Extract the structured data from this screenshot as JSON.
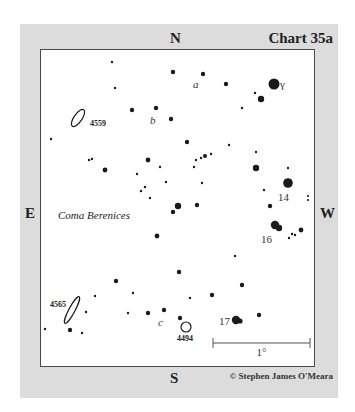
{
  "chart": {
    "title": "Chart 35a",
    "copyright": "© Stephen James O'Meara",
    "constellation": "Coma Berenices",
    "compass": {
      "north": "N",
      "south": "S",
      "east": "E",
      "west": "W"
    },
    "scale_bar": {
      "label": "1°",
      "x1": 213,
      "x2": 310,
      "y": 343
    }
  },
  "colors": {
    "frame": "#dcdcdc",
    "field": "#ffffff",
    "border": "#4a4a4a",
    "star": "#1a1a1a",
    "text": "#222222"
  },
  "labels": {
    "gamma": "γ",
    "star_14": "14",
    "star_16": "16",
    "star_17": "17",
    "a": "a",
    "b": "b",
    "c": "c"
  },
  "deep_sky_objects": [
    {
      "id": "4559",
      "label": "4559",
      "type": "galaxy",
      "cx": 78,
      "cy": 118,
      "rx": 4,
      "ry": 10,
      "rotate": 35,
      "label_x": 90,
      "label_y": 126
    },
    {
      "id": "4565",
      "label": "4565",
      "type": "galaxy",
      "cx": 72,
      "cy": 310,
      "rx": 3,
      "ry": 15,
      "rotate": 28,
      "label_x": 50,
      "label_y": 307
    },
    {
      "id": "4494",
      "label": "4494",
      "type": "galaxy",
      "cx": 186,
      "cy": 327,
      "rx": 5,
      "ry": 5,
      "rotate": 0,
      "label_x": 177,
      "label_y": 341
    }
  ],
  "stars": [
    {
      "x": 112,
      "y": 62,
      "r": 1.2
    },
    {
      "x": 115,
      "y": 88,
      "r": 1.2
    },
    {
      "x": 173,
      "y": 72,
      "r": 2.2
    },
    {
      "x": 203,
      "y": 74,
      "r": 2.2
    },
    {
      "x": 226,
      "y": 84,
      "r": 2.2
    },
    {
      "x": 274,
      "y": 84,
      "r": 5.5,
      "name": "gamma"
    },
    {
      "x": 255,
      "y": 93,
      "r": 1.2
    },
    {
      "x": 261,
      "y": 99,
      "r": 3.2
    },
    {
      "x": 242,
      "y": 108,
      "r": 1.2
    },
    {
      "x": 132,
      "y": 110,
      "r": 2.2
    },
    {
      "x": 156,
      "y": 108,
      "r": 2.2
    },
    {
      "x": 171,
      "y": 119,
      "r": 2.2
    },
    {
      "x": 51,
      "y": 139,
      "r": 1.2
    },
    {
      "x": 89,
      "y": 160,
      "r": 1.2
    },
    {
      "x": 92,
      "y": 159,
      "r": 1.2
    },
    {
      "x": 105,
      "y": 170,
      "r": 2.4
    },
    {
      "x": 187,
      "y": 142,
      "r": 2.2
    },
    {
      "x": 148,
      "y": 160,
      "r": 2.4
    },
    {
      "x": 160,
      "y": 167,
      "r": 1.2
    },
    {
      "x": 137,
      "y": 174,
      "r": 1.2
    },
    {
      "x": 166,
      "y": 182,
      "r": 1.2
    },
    {
      "x": 141,
      "y": 191,
      "r": 1.2
    },
    {
      "x": 145,
      "y": 187,
      "r": 1.2
    },
    {
      "x": 150,
      "y": 198,
      "r": 1.2
    },
    {
      "x": 178,
      "y": 206,
      "r": 3.2
    },
    {
      "x": 173,
      "y": 212,
      "r": 2.2
    },
    {
      "x": 197,
      "y": 205,
      "r": 2.2
    },
    {
      "x": 157,
      "y": 236,
      "r": 2.4
    },
    {
      "x": 229,
      "y": 145,
      "r": 1.2
    },
    {
      "x": 256,
      "y": 152,
      "r": 1.2
    },
    {
      "x": 196,
      "y": 160,
      "r": 1.2
    },
    {
      "x": 201,
      "y": 158,
      "r": 1.2
    },
    {
      "x": 205,
      "y": 156,
      "r": 2.0
    },
    {
      "x": 211,
      "y": 154,
      "r": 1.2
    },
    {
      "x": 194,
      "y": 167,
      "r": 1.2
    },
    {
      "x": 202,
      "y": 183,
      "r": 1.2
    },
    {
      "x": 256,
      "y": 168,
      "r": 3.2
    },
    {
      "x": 288,
      "y": 168,
      "r": 1.2
    },
    {
      "x": 288,
      "y": 183,
      "r": 4.8,
      "name": "star_14"
    },
    {
      "x": 264,
      "y": 190,
      "r": 1.2
    },
    {
      "x": 270,
      "y": 206,
      "r": 2.2
    },
    {
      "x": 308,
      "y": 196,
      "r": 1.1
    },
    {
      "x": 308,
      "y": 200,
      "r": 1.1
    },
    {
      "x": 275,
      "y": 225,
      "r": 4.2,
      "name": "star_16"
    },
    {
      "x": 279,
      "y": 228,
      "r": 3.2
    },
    {
      "x": 301,
      "y": 230,
      "r": 2.4
    },
    {
      "x": 292,
      "y": 234,
      "r": 1.2
    },
    {
      "x": 295,
      "y": 235,
      "r": 1.2
    },
    {
      "x": 289,
      "y": 238,
      "r": 1.2
    },
    {
      "x": 235,
      "y": 256,
      "r": 1.2
    },
    {
      "x": 179,
      "y": 272,
      "r": 2.2
    },
    {
      "x": 116,
      "y": 281,
      "r": 2.2
    },
    {
      "x": 242,
      "y": 285,
      "r": 2.2
    },
    {
      "x": 133,
      "y": 293,
      "r": 1.2
    },
    {
      "x": 95,
      "y": 296,
      "r": 1.2
    },
    {
      "x": 212,
      "y": 295,
      "r": 2.2
    },
    {
      "x": 190,
      "y": 298,
      "r": 1.2
    },
    {
      "x": 86,
      "y": 312,
      "r": 1.2
    },
    {
      "x": 128,
      "y": 313,
      "r": 1.2
    },
    {
      "x": 148,
      "y": 313,
      "r": 2.2
    },
    {
      "x": 164,
      "y": 310,
      "r": 2.2
    },
    {
      "x": 180,
      "y": 318,
      "r": 2.2
    },
    {
      "x": 45,
      "y": 329,
      "r": 1.2
    },
    {
      "x": 70,
      "y": 330,
      "r": 2.2
    },
    {
      "x": 82,
      "y": 333,
      "r": 1.2
    },
    {
      "x": 236,
      "y": 320,
      "r": 4.2,
      "name": "star_17"
    },
    {
      "x": 240,
      "y": 321,
      "r": 2.6
    },
    {
      "x": 259,
      "y": 315,
      "r": 2.2
    }
  ],
  "star_labels": [
    {
      "key": "gamma",
      "x": 280,
      "y": 88,
      "italic": false,
      "size": 11
    },
    {
      "key": "star_14",
      "x": 278,
      "y": 201,
      "italic": false,
      "size": 11
    },
    {
      "key": "star_16",
      "x": 261,
      "y": 243,
      "italic": false,
      "size": 11
    },
    {
      "key": "star_17",
      "x": 219,
      "y": 325,
      "italic": false,
      "size": 11
    },
    {
      "key": "a",
      "x": 193,
      "y": 88,
      "italic": true,
      "size": 11
    },
    {
      "key": "b",
      "x": 150,
      "y": 124,
      "italic": true,
      "size": 11
    },
    {
      "key": "c",
      "x": 158,
      "y": 326,
      "italic": true,
      "size": 11
    }
  ]
}
